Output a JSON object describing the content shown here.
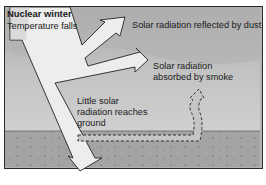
{
  "diagram": {
    "title": "Nuclear winter",
    "subtitle": "Temperature falls",
    "labels": {
      "reflected": "Solar radiation reflected by dust",
      "absorbed_line1": "Solar radiation",
      "absorbed_line2": "absorbed by smoke",
      "ground_line1": "Little solar",
      "ground_line2": "radiation reaches",
      "ground_line3": "ground"
    },
    "colors": {
      "sky_dark": "#9a9a9a",
      "sky_mid": "#bdbdbd",
      "sky_light": "#cfcfcf",
      "ground": "#a2a2a2",
      "arrow_fill": "#eeeeee",
      "outline": "#222222"
    }
  }
}
